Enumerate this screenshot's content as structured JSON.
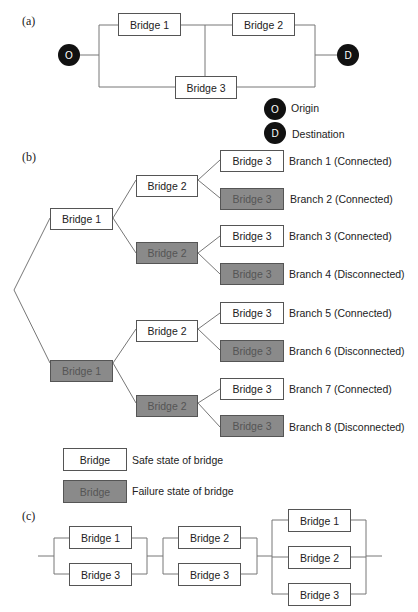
{
  "panels": {
    "a": "(a)",
    "b": "(b)",
    "c": "(c)"
  },
  "network": {
    "origin_symbol": "O",
    "destination_symbol": "D",
    "bridges": [
      "Bridge 1",
      "Bridge 2",
      "Bridge 3"
    ],
    "legend": {
      "origin_label": "Origin",
      "destination_label": "Destination"
    }
  },
  "tree": {
    "level1": [
      {
        "label": "Bridge 1",
        "state": "safe"
      },
      {
        "label": "Bridge 1",
        "state": "failure"
      }
    ],
    "level2": [
      {
        "label": "Bridge 2",
        "state": "safe"
      },
      {
        "label": "Bridge 2",
        "state": "failure"
      },
      {
        "label": "Bridge 2",
        "state": "safe"
      },
      {
        "label": "Bridge 2",
        "state": "failure"
      }
    ],
    "level3": [
      {
        "label": "Bridge 3",
        "state": "safe",
        "branch": "Branch 1 (Connected)"
      },
      {
        "label": "Bridge 3",
        "state": "failure",
        "branch": "Branch 2 (Connected)"
      },
      {
        "label": "Bridge 3",
        "state": "safe",
        "branch": "Branch 3 (Connected)"
      },
      {
        "label": "Bridge 3",
        "state": "failure",
        "branch": "Branch 4 (Disconnected)"
      },
      {
        "label": "Bridge 3",
        "state": "safe",
        "branch": "Branch 5 (Connected)"
      },
      {
        "label": "Bridge 3",
        "state": "failure",
        "branch": "Branch 6 (Disconnected)"
      },
      {
        "label": "Bridge 3",
        "state": "safe",
        "branch": "Branch 7 (Connected)"
      },
      {
        "label": "Bridge 3",
        "state": "failure",
        "branch": "Branch 8 (Disconnected)"
      }
    ],
    "legend": {
      "box_label": "Bridge",
      "safe_text": "Safe state of bridge",
      "failure_text": "Failure state of bridge"
    }
  },
  "cutsets": {
    "groups": [
      [
        "Bridge 1",
        "Bridge 3"
      ],
      [
        "Bridge 2",
        "Bridge 3"
      ],
      [
        "Bridge 1",
        "Bridge 2",
        "Bridge 3"
      ]
    ]
  },
  "colors": {
    "failure_fill": "#8a8a8a",
    "node_fill": "#111111"
  }
}
